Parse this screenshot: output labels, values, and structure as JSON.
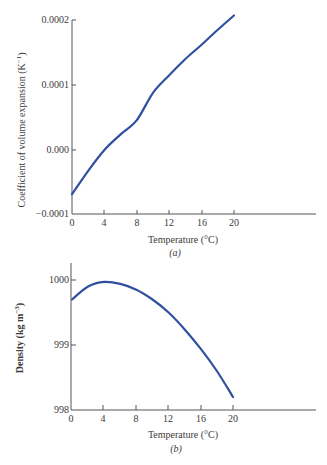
{
  "chart_data": [
    {
      "type": "line",
      "panel": "(a)",
      "title": "",
      "xlabel": "Temperature (°C)",
      "ylabel": "Coefficient of volume expansion (K⁻¹)",
      "x_ticks": [
        "0",
        "4",
        "8",
        "12",
        "16",
        "20"
      ],
      "y_ticks": [
        "0.0002",
        "0.0001",
        "0.000",
        "−0.0001"
      ],
      "xlim": [
        0,
        30
      ],
      "ylim": [
        -0.0001,
        0.0002
      ],
      "grid": false,
      "color": "#2f4f9f",
      "series": [
        {
          "name": "coefficient of volume expansion",
          "x": [
            0,
            2,
            4,
            6,
            8,
            10,
            12,
            14,
            16,
            18,
            20
          ],
          "y": [
            -6.8e-05,
            -3.2e-05,
            0.0,
            2.4e-05,
            4.6e-05,
            8.8e-05,
            0.000115,
            0.00014,
            0.000162,
            0.000185,
            0.000207
          ]
        }
      ]
    },
    {
      "type": "line",
      "panel": "(b)",
      "title": "",
      "xlabel": "Temperature (°C)",
      "ylabel": "Density (kg m⁻³)",
      "x_ticks": [
        "0",
        "4",
        "8",
        "12",
        "16",
        "20"
      ],
      "y_ticks": [
        "1000",
        "999",
        "998"
      ],
      "xlim": [
        0,
        30
      ],
      "ylim": [
        998,
        1000.3
      ],
      "grid": false,
      "color": "#2f4f9f",
      "series": [
        {
          "name": "density",
          "x": [
            0,
            2,
            4,
            6,
            8,
            10,
            12,
            14,
            16,
            18,
            20
          ],
          "y": [
            999.7,
            999.9,
            999.97,
            999.94,
            999.85,
            999.7,
            999.5,
            999.24,
            998.94,
            998.6,
            998.2
          ]
        }
      ]
    }
  ],
  "labels": {
    "a": {
      "ylabel": "Coefficient of volume expansion (K",
      "ylabel_sup": "−1",
      "ylabel_close": ")",
      "xlabel": "Temperature (°C)",
      "caption": "(a)",
      "yticks": [
        "0.0002",
        "0.0001",
        "0.000",
        "−0.0001"
      ],
      "xticks": [
        "0",
        "4",
        "8",
        "12",
        "16",
        "20"
      ]
    },
    "b": {
      "ylabel": "Density (kg m",
      "ylabel_sup": "−3",
      "ylabel_close": ")",
      "xlabel": "Temperature (°C)",
      "caption": "(b)",
      "yticks": [
        "1000",
        "999",
        "998"
      ],
      "xticks": [
        "0",
        "4",
        "8",
        "12",
        "16",
        "20"
      ]
    }
  }
}
